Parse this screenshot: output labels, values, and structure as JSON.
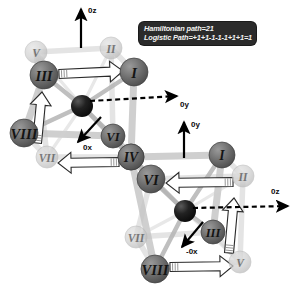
{
  "figure": {
    "background_color": "#ffffff",
    "node_fill_front": "#6e6e6e",
    "node_fill_back": "#c9c9c9",
    "hub_fill": "#1a1a1a",
    "edge_color": "#c4c4c4",
    "arrow_fill": "#ffffff",
    "arrow_stroke": "#2a2a2a",
    "axis_color": "#000000"
  },
  "caption": {
    "background_color": "#2b2b2b",
    "text_color": "#f2f2f2",
    "line1": "Hamiltonian path=21",
    "line2": "Logistic Path=+1+1-1-1-1+1+1=1"
  },
  "cubes": [
    {
      "id": "upper-cube",
      "name": "upper-cube",
      "nodes": [
        {
          "label": "V",
          "x": 36,
          "y": 52,
          "depth": "back",
          "r": 11
        },
        {
          "label": "II",
          "x": 111,
          "y": 48,
          "depth": "back",
          "r": 11
        },
        {
          "label": "III",
          "x": 44,
          "y": 75,
          "depth": "front",
          "r": 14
        },
        {
          "label": "I",
          "x": 134,
          "y": 72,
          "depth": "front",
          "r": 14
        },
        {
          "label": "VIII",
          "x": 24,
          "y": 133,
          "depth": "front",
          "r": 14
        },
        {
          "label": "VI",
          "x": 113,
          "y": 136,
          "depth": "front",
          "r": 12
        },
        {
          "label": "VII",
          "x": 47,
          "y": 157,
          "depth": "back",
          "r": 11
        },
        {
          "label": "IV",
          "x": 131,
          "y": 157,
          "depth": "front",
          "r": 13
        }
      ],
      "hub": {
        "x": 82,
        "y": 106,
        "r": 11
      },
      "axes": [
        {
          "label": "0z",
          "lx": 88,
          "ly": 10,
          "style": "solid",
          "x1": 81,
          "y1": 48,
          "x2": 81,
          "y2": 9
        },
        {
          "label": "0y",
          "lx": 180,
          "ly": 104,
          "style": "dashed",
          "x1": 90,
          "y1": 101,
          "x2": 177,
          "y2": 96
        },
        {
          "label": "0x",
          "lx": 83,
          "ly": 147,
          "style": "solid",
          "x1": 101,
          "y1": 117,
          "x2": 78,
          "y2": 142
        }
      ]
    },
    {
      "id": "lower-cube",
      "name": "lower-cube",
      "nodes": [
        {
          "label": "IV",
          "x": 131,
          "y": 157,
          "depth": "front",
          "r": 13
        },
        {
          "label": "I",
          "x": 222,
          "y": 155,
          "depth": "front",
          "r": 13
        },
        {
          "label": "VI",
          "x": 151,
          "y": 179,
          "depth": "front",
          "r": 14
        },
        {
          "label": "II",
          "x": 243,
          "y": 176,
          "depth": "back",
          "r": 11
        },
        {
          "label": "VII",
          "x": 136,
          "y": 237,
          "depth": "back",
          "r": 11
        },
        {
          "label": "III",
          "x": 213,
          "y": 232,
          "depth": "front",
          "r": 12
        },
        {
          "label": "VIII",
          "x": 155,
          "y": 269,
          "depth": "front",
          "r": 14
        },
        {
          "label": "V",
          "x": 240,
          "y": 262,
          "depth": "back",
          "r": 11
        }
      ],
      "hub": {
        "x": 185,
        "y": 211,
        "r": 11
      },
      "axes": [
        {
          "label": "0y",
          "lx": 191,
          "ly": 124,
          "style": "solid",
          "x1": 184,
          "y1": 158,
          "x2": 184,
          "y2": 122
        },
        {
          "label": "0z",
          "lx": 271,
          "ly": 191,
          "style": "dashed",
          "x1": 193,
          "y1": 208,
          "x2": 288,
          "y2": 206
        },
        {
          "label": "-0x",
          "lx": 186,
          "ly": 251,
          "style": "solid",
          "x1": 203,
          "y1": 222,
          "x2": 182,
          "y2": 247
        }
      ]
    }
  ],
  "block_arrows": [
    {
      "name": "arrow-upper-iii-to-i",
      "x1": 59,
      "y1": 74,
      "x2": 123,
      "y2": 71,
      "w": 9,
      "dir": "right"
    },
    {
      "name": "arrow-upper-viii-to-iii",
      "x1": 37,
      "y1": 143,
      "x2": 42,
      "y2": 92,
      "w": 9,
      "dir": "up"
    },
    {
      "name": "arrow-upper-iv-to-vii",
      "x1": 119,
      "y1": 162,
      "x2": 58,
      "y2": 163,
      "w": 9,
      "dir": "left"
    },
    {
      "name": "arrow-lower-ii-to-vi",
      "x1": 233,
      "y1": 182,
      "x2": 166,
      "y2": 183,
      "w": 9,
      "dir": "left"
    },
    {
      "name": "arrow-lower-v-to-ii",
      "x1": 229,
      "y1": 253,
      "x2": 234,
      "y2": 198,
      "w": 9,
      "dir": "up"
    },
    {
      "name": "arrow-lower-viii-to-v",
      "x1": 170,
      "y1": 267,
      "x2": 233,
      "y2": 266,
      "w": 9,
      "dir": "right"
    }
  ]
}
